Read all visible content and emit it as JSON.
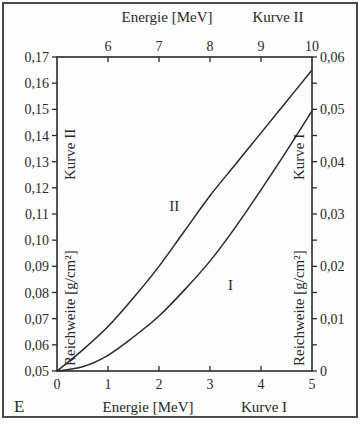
{
  "chart_data": {
    "type": "line",
    "corner_label": "E",
    "bottom_axis": {
      "label": "Energie [MeV]",
      "curve_label": "Kurve I",
      "ticks": [
        "0",
        "1",
        "2",
        "3",
        "4",
        "5"
      ],
      "range": [
        0,
        5
      ]
    },
    "top_axis": {
      "label": "Energie [MeV]",
      "curve_label": "Kurve II",
      "ticks": [
        "6",
        "7",
        "8",
        "9",
        "10"
      ],
      "range": [
        5,
        10
      ]
    },
    "left_axis": {
      "label": "Reichweite [g/cm²]",
      "curve_label": "Kurve II",
      "ticks": [
        "0,05",
        "0,06",
        "0,07",
        "0,08",
        "0,09",
        "0,10",
        "0,11",
        "0,12",
        "0,13",
        "0,14",
        "0,15",
        "0,16",
        "0,17"
      ],
      "range": [
        0.05,
        0.17
      ]
    },
    "right_axis": {
      "label": "Reichweite [g/cm²]",
      "curve_label": "Kurve I",
      "ticks": [
        "0",
        "0,01",
        "0,02",
        "0,03",
        "0,04",
        "0,05",
        "0,06"
      ],
      "range": [
        0,
        0.06
      ]
    },
    "series": [
      {
        "name": "I",
        "axes": "bottom/right",
        "x": [
          0,
          0.5,
          1,
          1.5,
          2,
          2.5,
          3,
          3.5,
          4,
          4.5,
          5
        ],
        "values": [
          0,
          0.0008,
          0.003,
          0.0065,
          0.0105,
          0.0155,
          0.021,
          0.0275,
          0.0346,
          0.042,
          0.0497
        ]
      },
      {
        "name": "II",
        "axes": "top/left",
        "x": [
          5,
          5.5,
          6,
          6.5,
          7,
          7.5,
          8,
          8.5,
          9,
          9.5,
          10
        ],
        "values": [
          0.05,
          0.058,
          0.067,
          0.078,
          0.09,
          0.1035,
          0.117,
          0.129,
          0.141,
          0.153,
          0.165
        ]
      }
    ],
    "curve_labels": [
      {
        "text": "II",
        "x": 7.3,
        "y_left": 0.111
      },
      {
        "text": "I",
        "x": 3.4,
        "y_right": 0.0155
      }
    ],
    "grid": false
  }
}
